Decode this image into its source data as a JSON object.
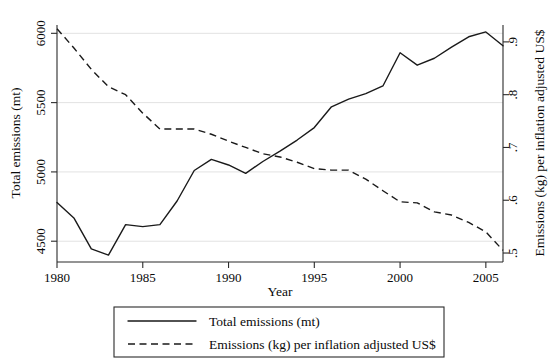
{
  "chart_data": {
    "type": "line",
    "title": "",
    "xlabel": "Year",
    "ylabel": "Total emissions (mt)",
    "y2label": "Emissions (kg) per inflation adjusted US$",
    "grid": true,
    "legend_position": "bottom",
    "xlim": [
      1980,
      2006
    ],
    "ylim": [
      4350,
      6060
    ],
    "y2lim": [
      0.483,
      0.932
    ],
    "xticks": [
      1980,
      1985,
      1990,
      1995,
      2000,
      2005
    ],
    "xtick_labels": [
      "1980",
      "1985",
      "1990",
      "1995",
      "2000",
      "2005"
    ],
    "yticks": [
      4500,
      5000,
      5500,
      6000
    ],
    "ytick_labels": [
      "4500",
      "5000",
      "5500",
      "6000"
    ],
    "y2ticks": [
      0.5,
      0.6,
      0.7,
      0.8,
      0.9
    ],
    "y2tick_labels": [
      ".5",
      ".6",
      ".7",
      ".8",
      ".9"
    ],
    "x": [
      1980,
      1981,
      1982,
      1983,
      1984,
      1985,
      1986,
      1987,
      1988,
      1989,
      1990,
      1991,
      1992,
      1993,
      1994,
      1995,
      1996,
      1997,
      1998,
      1999,
      2000,
      2001,
      2002,
      2003,
      2004,
      2005,
      2006
    ],
    "series": [
      {
        "name": "Total emissions (mt)",
        "axis": "left",
        "style": "solid",
        "values": [
          4780,
          4665,
          4445,
          4400,
          4620,
          4605,
          4620,
          4790,
          5010,
          5090,
          5050,
          4990,
          5075,
          5150,
          5230,
          5320,
          5470,
          5525,
          5565,
          5620,
          5860,
          5770,
          5820,
          5900,
          5975,
          6010,
          5910
        ]
      },
      {
        "name": "Emissions (kg) per inflation adjusted US$",
        "axis": "right",
        "style": "dashed",
        "values": [
          0.925,
          0.888,
          0.848,
          0.815,
          0.8,
          0.765,
          0.735,
          0.735,
          0.735,
          0.725,
          0.712,
          0.7,
          0.688,
          0.682,
          0.672,
          0.66,
          0.657,
          0.657,
          0.64,
          0.618,
          0.597,
          0.595,
          0.578,
          0.572,
          0.558,
          0.54,
          0.505
        ]
      }
    ],
    "legend": [
      {
        "label": "Total emissions (mt)",
        "style": "solid"
      },
      {
        "label": "Emissions (kg) per inflation adjusted US$",
        "style": "dashed"
      }
    ]
  }
}
